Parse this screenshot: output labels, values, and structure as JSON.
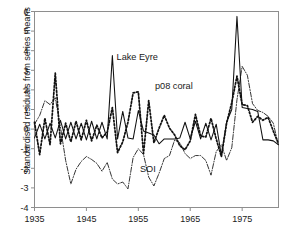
{
  "chart_data": {
    "type": "line",
    "title": "",
    "subtitle": "",
    "xlabel": "",
    "ylabel": "Standardised residuals from series means",
    "xlim": [
      1935,
      1982
    ],
    "ylim": [
      -4,
      6
    ],
    "grid": false,
    "legend_position": "inline-annotations",
    "xticks": [
      "1935",
      "1945",
      "1955",
      "1965",
      "1975"
    ],
    "xtick_values": [
      1935,
      1945,
      1955,
      1965,
      1975
    ],
    "yticks": [
      "6",
      "5",
      "4",
      "3",
      "2",
      "1",
      "0",
      "-1",
      "-2",
      "-3",
      "-4"
    ],
    "ytick_values": [
      6,
      5,
      4,
      3,
      2,
      1,
      0,
      -1,
      -2,
      -3,
      -4
    ],
    "annotations": [
      {
        "text": "Lake Eyre",
        "x": 1950.8,
        "y": 3.55,
        "name": "lake-eyre-label"
      },
      {
        "text": "p08 coral",
        "x": 1958.2,
        "y": 2.05,
        "name": "p08-coral-label"
      },
      {
        "text": "SOI",
        "x": 1955.3,
        "y": -2.2,
        "name": "soi-label"
      }
    ],
    "x": [
      1935,
      1936,
      1937,
      1938,
      1939,
      1940,
      1941,
      1942,
      1943,
      1944,
      1945,
      1946,
      1947,
      1948,
      1949,
      1950,
      1951,
      1952,
      1953,
      1954,
      1955,
      1956,
      1957,
      1958,
      1959,
      1960,
      1961,
      1962,
      1963,
      1964,
      1965,
      1966,
      1967,
      1968,
      1969,
      1970,
      1971,
      1972,
      1973,
      1974,
      1975,
      1976,
      1977,
      1978,
      1979,
      1980,
      1981,
      1982
    ],
    "series": [
      {
        "name": "Lake Eyre",
        "style": "solid",
        "values": [
          -0.45,
          0.25,
          -0.5,
          0.3,
          -0.45,
          0.45,
          -0.5,
          0.35,
          -0.5,
          0.3,
          -0.55,
          0.4,
          -0.5,
          0.35,
          -0.5,
          3.75,
          -0.5,
          0.9,
          -0.45,
          -0.5,
          0.95,
          -0.1,
          -0.2,
          -0.3,
          -0.75,
          -0.5,
          -0.5,
          -0.5,
          -0.45,
          0.35,
          -0.5,
          0.4,
          -0.5,
          0.3,
          -0.55,
          0.25,
          -1.35,
          0.35,
          1.0,
          5.75,
          1.1,
          1.05,
          1.0,
          0.9,
          -0.55,
          -0.55,
          -0.6,
          -0.8
        ]
      },
      {
        "name": "p08 coral",
        "style": "dotted",
        "values": [
          0.35,
          -1.3,
          0.55,
          -0.8,
          2.85,
          -0.75,
          0.3,
          -0.65,
          0.4,
          -0.55,
          0.45,
          -0.6,
          0.2,
          -0.45,
          -0.15,
          1.1,
          -1.2,
          -0.65,
          0.35,
          1.85,
          1.9,
          -1.25,
          1.45,
          -0.7,
          0.05,
          0.7,
          0.05,
          -0.3,
          -0.85,
          -1.05,
          -0.6,
          0.75,
          -0.35,
          -0.4,
          0.55,
          -0.5,
          -1.4,
          0.3,
          1.35,
          2.7,
          1.25,
          1.2,
          0.35,
          0.65,
          0.45,
          0.6,
          -0.1,
          -0.75
        ]
      },
      {
        "name": "SOI",
        "style": "dash-dot",
        "values": [
          0.25,
          0.7,
          1.45,
          1.25,
          1.6,
          0.1,
          -1.6,
          -2.8,
          -2.05,
          -1.65,
          -1.4,
          -1.55,
          -1.75,
          -2.15,
          -1.7,
          -2.55,
          -2.8,
          -2.7,
          -3.05,
          -1.45,
          -1.0,
          -1.3,
          -2.45,
          -2.9,
          -2.25,
          -1.5,
          -1.35,
          -0.55,
          -0.7,
          -1.25,
          -1.5,
          -1.35,
          -1.35,
          -1.6,
          -2.35,
          -1.15,
          -0.8,
          -1.6,
          -0.95,
          1.5,
          3.2,
          2.75,
          1.3,
          0.95,
          0.85,
          0.65,
          0.3,
          -0.85
        ]
      }
    ]
  }
}
